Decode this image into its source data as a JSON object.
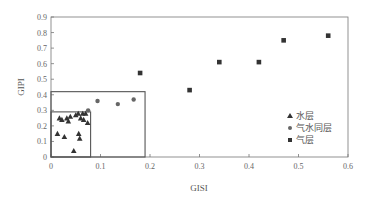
{
  "chart_data": {
    "type": "scatter",
    "title": "",
    "xlabel": "GISI",
    "ylabel": "GIPI",
    "xlim": [
      0,
      0.6
    ],
    "ylim": [
      0,
      0.9
    ],
    "xticks": [
      "0",
      "0.1",
      "0.2",
      "0.3",
      "0.4",
      "0.5",
      "0.6"
    ],
    "yticks": [
      "0",
      "0.1",
      "0.2",
      "0.3",
      "0.4",
      "0.5",
      "0.6",
      "0.7",
      "0.8",
      "0.9"
    ],
    "grid": false,
    "legend_position": "lower right (inside)",
    "series": [
      {
        "name": "水层",
        "marker": "triangle",
        "color": "#333333",
        "points": [
          [
            0.013,
            0.15
          ],
          [
            0.017,
            0.25
          ],
          [
            0.022,
            0.24
          ],
          [
            0.027,
            0.13
          ],
          [
            0.032,
            0.25
          ],
          [
            0.035,
            0.23
          ],
          [
            0.039,
            0.26
          ],
          [
            0.046,
            0.04
          ],
          [
            0.05,
            0.27
          ],
          [
            0.055,
            0.28
          ],
          [
            0.056,
            0.15
          ],
          [
            0.058,
            0.12
          ],
          [
            0.06,
            0.25
          ],
          [
            0.064,
            0.28
          ],
          [
            0.066,
            0.24
          ],
          [
            0.07,
            0.28
          ],
          [
            0.074,
            0.22
          ]
        ]
      },
      {
        "name": "气水同层",
        "marker": "circle",
        "color": "#666666",
        "points": [
          [
            0.075,
            0.3
          ],
          [
            0.094,
            0.36
          ],
          [
            0.135,
            0.34
          ],
          [
            0.167,
            0.37
          ]
        ]
      },
      {
        "name": "气层",
        "marker": "square",
        "color": "#333333",
        "points": [
          [
            0.18,
            0.54
          ],
          [
            0.28,
            0.43
          ],
          [
            0.34,
            0.61
          ],
          [
            0.42,
            0.61
          ],
          [
            0.47,
            0.75
          ],
          [
            0.56,
            0.78
          ]
        ]
      }
    ],
    "annotations": [
      {
        "type": "rectangle",
        "x": [
          0,
          0.08
        ],
        "y": [
          0,
          0.29
        ],
        "label": "water-layer region"
      },
      {
        "type": "rectangle",
        "x": [
          0,
          0.19
        ],
        "y": [
          0,
          0.42
        ],
        "label": "gas-water region"
      }
    ]
  },
  "legend": {
    "items": [
      {
        "label": "水层",
        "marker": "triangle"
      },
      {
        "label": "气水同层",
        "marker": "circle"
      },
      {
        "label": "气层",
        "marker": "square"
      }
    ]
  },
  "colors": {
    "axis": "#777777",
    "marker_dark": "#333333",
    "marker_circle": "#666666"
  }
}
